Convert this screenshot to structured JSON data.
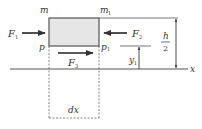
{
  "diagram": {
    "colors": {
      "line": "#444444",
      "element_fill": "#e6e6e6",
      "element_border": "#555555",
      "dashed": "#666666"
    },
    "element": {
      "top_left_label": "m",
      "top_right_label": "m",
      "top_right_subscript": "1",
      "bottom_left_label": "p",
      "bottom_right_label": "p",
      "bottom_right_subscript": "1"
    },
    "forces": [
      {
        "name": "F",
        "subscript": "1",
        "direction": "right",
        "position": "left side"
      },
      {
        "name": "F",
        "subscript": "2",
        "direction": "left",
        "position": "right side"
      },
      {
        "name": "F",
        "subscript": "3",
        "direction": "right",
        "position": "bottom"
      }
    ],
    "dimensions": {
      "half_height_numerator": "h",
      "half_height_denominator": "2",
      "y_label": "y",
      "y_subscript": "1",
      "width_label": "dx"
    },
    "axis": {
      "label": "x"
    }
  }
}
